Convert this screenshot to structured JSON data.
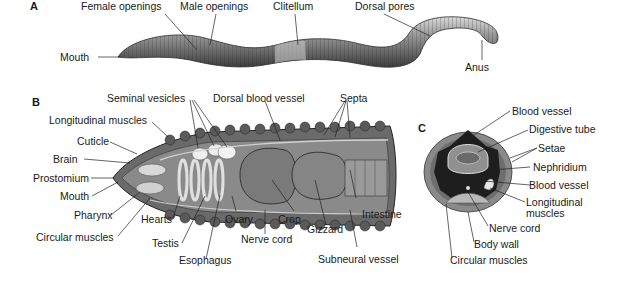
{
  "figure": {
    "panels": [
      {
        "id": "A",
        "letter": "A",
        "description": "External view of earthworm",
        "labels": [
          "Female openings",
          "Male openings",
          "Clitellum",
          "Dorsal pores",
          "Mouth",
          "Anus"
        ]
      },
      {
        "id": "B",
        "letter": "B",
        "description": "Longitudinal section of anterior end",
        "labels": [
          "Seminal vesicles",
          "Dorsal blood vessel",
          "Septa",
          "Longitudinal muscles",
          "Cuticle",
          "Brain",
          "Prostomium",
          "Mouth",
          "Pharynx",
          "Circular muscles",
          "Hearts",
          "Testis",
          "Esophagus",
          "Ovary",
          "Crop",
          "Nerve cord",
          "Gizzard",
          "Intestine",
          "Subneural vessel"
        ]
      },
      {
        "id": "C",
        "letter": "C",
        "description": "Cross section",
        "labels": [
          "Blood vessel",
          "Digestive tube",
          "Setae",
          "Nephridium",
          "Blood vessel",
          "Longitudinal muscles",
          "Nerve cord",
          "Body wall",
          "Circular muscles"
        ]
      }
    ]
  },
  "a": {
    "letter": "A",
    "female_openings": "Female openings",
    "male_openings": "Male openings",
    "clitellum": "Clitellum",
    "dorsal_pores": "Dorsal pores",
    "mouth": "Mouth",
    "anus": "Anus"
  },
  "b": {
    "letter": "B",
    "seminal_vesicles": "Seminal vesicles",
    "dorsal_blood_vessel": "Dorsal blood vessel",
    "septa": "Septa",
    "longitudinal_muscles": "Longitudinal muscles",
    "cuticle": "Cuticle",
    "brain": "Brain",
    "prostomium": "Prostomium",
    "mouth": "Mouth",
    "pharynx": "Pharynx",
    "circular_muscles": "Circular muscles",
    "hearts": "Hearts",
    "testis": "Testis",
    "esophagus": "Esophagus",
    "ovary": "Ovary",
    "crop": "Crop",
    "nerve_cord": "Nerve cord",
    "gizzard": "Gizzard",
    "intestine": "Intestine",
    "subneural_vessel": "Subneural vessel"
  },
  "c": {
    "letter": "C",
    "blood_vessel_top": "Blood vessel",
    "digestive_tube": "Digestive tube",
    "setae": "Setae",
    "nephridium": "Nephridium",
    "blood_vessel_bottom": "Blood vessel",
    "longitudinal_1": "Longitudinal",
    "longitudinal_2": "muscles",
    "nerve_cord": "Nerve cord",
    "body_wall": "Body wall",
    "circular_muscles": "Circular muscles"
  }
}
